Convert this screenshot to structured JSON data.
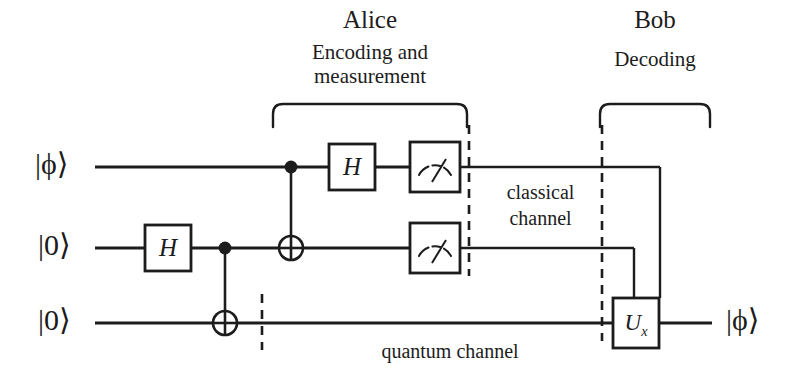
{
  "figure": {
    "stroke_color": "#1c1c1c",
    "background_color": "#ffffff"
  },
  "parties": {
    "alice": {
      "name": "Alice",
      "subtitle_line1": "Encoding and",
      "subtitle_line2": "measurement",
      "brace_icon": "curly-brace-down-icon"
    },
    "bob": {
      "name": "Bob",
      "subtitle_line1": "Decoding",
      "brace_icon": "curly-brace-down-icon"
    }
  },
  "wires": [
    {
      "id": "wire-0",
      "input_label": "|ϕ⟩",
      "y": 167
    },
    {
      "id": "wire-1",
      "input_label": "|0⟩",
      "y": 248
    },
    {
      "id": "wire-2",
      "input_label": "|0⟩",
      "y": 323
    }
  ],
  "outputs": [
    {
      "id": "output-0",
      "label": "|ϕ⟩",
      "wire": "wire-2"
    }
  ],
  "gates": [
    {
      "id": "h-gate-wire1",
      "type": "hadamard",
      "label": "H",
      "wire": "wire-1",
      "x": 145,
      "width": 46,
      "height": 46
    },
    {
      "id": "cnot-wire1-wire2",
      "type": "cnot",
      "control_wire": "wire-1",
      "target_wire": "wire-2",
      "x": 225
    },
    {
      "id": "cnot-wire0-wire1",
      "type": "cnot",
      "control_wire": "wire-0",
      "target_wire": "wire-1",
      "x": 291
    },
    {
      "id": "h-gate-wire0",
      "type": "hadamard",
      "label": "H",
      "wire": "wire-0",
      "x": 329,
      "width": 46,
      "height": 46
    },
    {
      "id": "measure-wire0",
      "type": "measurement",
      "wire": "wire-0",
      "x": 410,
      "width": 50,
      "height": 50
    },
    {
      "id": "measure-wire1",
      "type": "measurement",
      "wire": "wire-1",
      "x": 410,
      "width": 50,
      "height": 50
    },
    {
      "id": "ux-gate",
      "type": "unitary",
      "label": "U",
      "subscript": "x",
      "wire": "wire-2",
      "x": 613,
      "width": 46,
      "height": 50
    }
  ],
  "channels": [
    {
      "id": "classical-channel",
      "line1": "classical",
      "line2": "channel"
    },
    {
      "id": "quantum-channel",
      "line1": "quantum channel"
    }
  ],
  "dividers": [
    {
      "id": "divider-alice-boundary",
      "style": "dashed",
      "x": 469,
      "y1": 125,
      "y2": 276
    },
    {
      "id": "divider-bob-boundary",
      "style": "dashed",
      "x": 602,
      "y1": 125,
      "y2": 341
    },
    {
      "id": "divider-quantum-channel-start",
      "style": "dashed",
      "x": 262,
      "y1": 294,
      "y2": 348
    }
  ]
}
